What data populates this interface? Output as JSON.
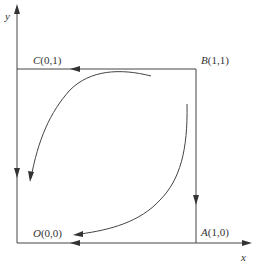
{
  "diagram": {
    "type": "phase-portrait",
    "axes": {
      "x_label": "x",
      "y_label": "y"
    },
    "points": [
      {
        "id": "O",
        "name": "O",
        "coords": "(0,0)"
      },
      {
        "id": "A",
        "name": "A",
        "coords": "(1,0)"
      },
      {
        "id": "B",
        "name": "B",
        "coords": "(1,1)"
      },
      {
        "id": "C",
        "name": "C",
        "coords": "(0,1)"
      }
    ],
    "edges": [
      {
        "from": "B",
        "to": "C",
        "direction": "left"
      },
      {
        "from": "C",
        "to": "O",
        "direction": "down"
      },
      {
        "from": "B",
        "to": "A",
        "direction": "down"
      },
      {
        "from": "A",
        "to": "O",
        "direction": "left"
      }
    ],
    "trajectories": [
      {
        "description": "curve from near B-C edge arcing toward O along left side",
        "direction": "toward O"
      },
      {
        "description": "curve from near B-A edge arcing toward O along bottom side",
        "direction": "toward O"
      }
    ],
    "colors": {
      "line": "#333333",
      "background": "#ffffff"
    }
  }
}
